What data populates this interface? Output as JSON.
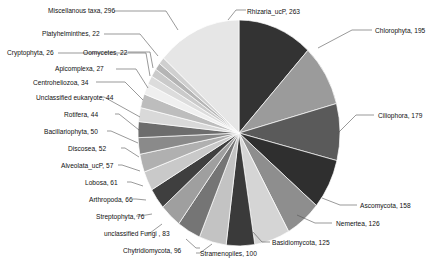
{
  "chart_data": {
    "type": "pie",
    "title": "",
    "xlabel": "",
    "ylabel": "",
    "legend_position": "none",
    "grid": false,
    "label_format": "name, value",
    "total": 1753,
    "categories": [
      "Rhizaria_ucP",
      "Chlorophyta",
      "Ciliophora",
      "Ascomycota",
      "Nemertea",
      "Basidiomycota",
      "Stramenopiles",
      "Chytridiomycota",
      "unclassified Fungi ",
      "Streptophyta",
      "Arthropoda",
      "Lobosa",
      "Alveolata_ucP",
      "Discosea",
      "Bacillariophyta",
      "Rotifera",
      "Unclassified eukaryote",
      "Centroheliozoa",
      "Apicomplexa",
      "Cryptophyta",
      "Oomycetes",
      "Platyhelminthes",
      "Miscellanous taxa"
    ],
    "values": [
      263,
      195,
      179,
      158,
      126,
      125,
      100,
      96,
      83,
      76,
      66,
      61,
      57,
      52,
      50,
      44,
      44,
      34,
      27,
      26,
      22,
      22,
      296
    ],
    "labels": [
      "Rhizaria_ucP, 263",
      "Chlorophyta, 195",
      "Ciliophora, 179",
      "Ascomycota, 158",
      "Nemertea, 126",
      "Basidiomycota, 125",
      "Stramenopiles, 100",
      "Chytridiomycota, 96",
      "unclassified Fungi , 83",
      "Streptophyta, 76",
      "Arthropoda, 66",
      "Lobosa, 61",
      "Alveolata_ucP, 57",
      "Discosea, 52",
      "Bacillariophyta, 50",
      "Rotifera, 44",
      "Unclassified eukaryote, 44",
      "Centroheliozoa, 34",
      "Apicomplexa, 27",
      "Cryptophyta, 26",
      "Oomycetes, 22",
      "Platyhelminthes, 22",
      "Miscellanous taxa, 296"
    ],
    "colors": [
      "#333333",
      "#9b9b9b",
      "#5a5a5a",
      "#2f2f2f",
      "#8e8e8e",
      "#d5d5d5",
      "#3a3a3a",
      "#c3c3c3",
      "#757575",
      "#9f9f9f",
      "#3f3f3f",
      "#c9c9c9",
      "#b0b0b0",
      "#8a8a8a",
      "#6d6d6d",
      "#d9d9d9",
      "#bdbdbd",
      "#efefef",
      "#dcdcdc",
      "#cacaca",
      "#b5b5b5",
      "#cfcfcf",
      "#e6e6e6"
    ]
  },
  "layout": {
    "center_x": 239,
    "center_y": 133,
    "radius_x": 101,
    "radius_y": 113,
    "start_angle_deg": -90
  },
  "label_layout": [
    {
      "key": "Rhizaria_ucP",
      "x": 247,
      "y": 14,
      "anchor": "start",
      "line": [
        [
          244,
          18
        ],
        [
          236,
          9
        ],
        [
          215,
          9
        ]
      ]
    },
    {
      "key": "Chlorophyta",
      "x": 375,
      "y": 33,
      "anchor": "start",
      "line": [
        [
          372,
          37
        ],
        [
          353,
          28
        ],
        [
          330,
          28
        ]
      ]
    },
    {
      "key": "Ciliophora",
      "x": 378,
      "y": 118,
      "anchor": "start",
      "line": [
        [
          375,
          122
        ],
        [
          356,
          113
        ],
        [
          338,
          113
        ]
      ]
    },
    {
      "key": "Ascomycota",
      "x": 360,
      "y": 208,
      "anchor": "start",
      "line": [
        [
          357,
          212
        ],
        [
          340,
          203
        ],
        [
          322,
          203
        ]
      ]
    },
    {
      "key": "Nemertea",
      "x": 336,
      "y": 226,
      "anchor": "start",
      "line": [
        [
          333,
          230
        ],
        [
          315,
          221
        ],
        [
          297,
          221
        ]
      ]
    },
    {
      "key": "Basidiomycota",
      "x": 272,
      "y": 245,
      "anchor": "start",
      "line": [
        [
          269,
          249
        ],
        [
          258,
          240
        ],
        [
          248,
          240
        ]
      ]
    },
    {
      "key": "Stramenopiles",
      "x": 200,
      "y": 256,
      "anchor": "start",
      "line": [
        [
          197,
          260
        ],
        [
          190,
          251
        ],
        [
          186,
          251
        ]
      ]
    },
    {
      "key": "Chytridiomycota",
      "x": 123,
      "y": 253,
      "anchor": "start",
      "line": [
        [
          190,
          249
        ],
        [
          178,
          242
        ],
        [
          170,
          242
        ]
      ]
    },
    {
      "key": "unclassified Fungi ",
      "x": 104,
      "y": 236,
      "anchor": "start",
      "line": [
        [
          0,
          0
        ],
        [
          0,
          0
        ],
        [
          0,
          0
        ]
      ]
    },
    {
      "key": "Streptophyta",
      "x": 96,
      "y": 219,
      "anchor": "start",
      "line": [
        [
          0,
          0
        ],
        [
          0,
          0
        ],
        [
          0,
          0
        ]
      ]
    },
    {
      "key": "Arthropoda",
      "x": 89,
      "y": 202,
      "anchor": "start",
      "line": [
        [
          0,
          0
        ],
        [
          0,
          0
        ],
        [
          0,
          0
        ]
      ]
    },
    {
      "key": "Lobosa",
      "x": 85,
      "y": 185,
      "anchor": "start",
      "line": [
        [
          0,
          0
        ],
        [
          0,
          0
        ],
        [
          0,
          0
        ]
      ]
    },
    {
      "key": "Alveolata_ucP",
      "x": 61,
      "y": 168,
      "anchor": "start",
      "line": [
        [
          0,
          0
        ],
        [
          0,
          0
        ],
        [
          0,
          0
        ]
      ]
    },
    {
      "key": "Discosea",
      "x": 68,
      "y": 151,
      "anchor": "start",
      "line": [
        [
          0,
          0
        ],
        [
          0,
          0
        ],
        [
          0,
          0
        ]
      ]
    },
    {
      "key": "Bacillariophyta",
      "x": 44,
      "y": 134,
      "anchor": "start",
      "line": [
        [
          0,
          0
        ],
        [
          0,
          0
        ],
        [
          0,
          0
        ]
      ]
    },
    {
      "key": "Rotifera",
      "x": 64,
      "y": 117,
      "anchor": "start",
      "line": [
        [
          0,
          0
        ],
        [
          0,
          0
        ],
        [
          0,
          0
        ]
      ]
    },
    {
      "key": "Unclassified eukaryote",
      "x": 36,
      "y": 100,
      "anchor": "start",
      "line": [
        [
          0,
          0
        ],
        [
          0,
          0
        ],
        [
          0,
          0
        ]
      ]
    },
    {
      "key": "Centroheliozoa",
      "x": 33,
      "y": 85,
      "anchor": "start",
      "line": [
        [
          96,
          82
        ],
        [
          125,
          82
        ],
        [
          143,
          90
        ]
      ]
    },
    {
      "key": "Apicomplexa",
      "x": 55,
      "y": 71,
      "anchor": "start",
      "line": [
        [
          115,
          68
        ],
        [
          135,
          68
        ],
        [
          152,
          78
        ]
      ]
    },
    {
      "key": "Cryptophyta",
      "x": 7,
      "y": 55,
      "anchor": "start",
      "line": [
        [
          57,
          52
        ],
        [
          140,
          52
        ],
        [
          152,
          62
        ]
      ]
    },
    {
      "key": "Oomycetes",
      "x": 83,
      "y": 55,
      "anchor": "start",
      "line": [
        [
          0,
          0
        ],
        [
          0,
          0
        ],
        [
          0,
          0
        ]
      ]
    },
    {
      "key": "Platyhelminthes",
      "x": 42,
      "y": 36,
      "anchor": "start",
      "line": [
        [
          103,
          33
        ],
        [
          135,
          33
        ],
        [
          155,
          48
        ]
      ]
    },
    {
      "key": "Miscellanous taxa",
      "x": 48,
      "y": 13,
      "anchor": "start",
      "line": [
        [
          113,
          10
        ],
        [
          162,
          10
        ],
        [
          175,
          22
        ]
      ]
    }
  ]
}
